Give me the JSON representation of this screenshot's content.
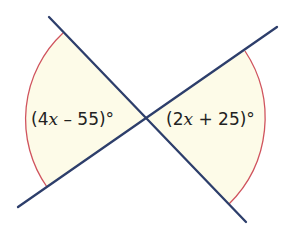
{
  "diagram": {
    "type": "vertical-angles",
    "intersection": {
      "x": 145,
      "y": 118
    },
    "lines": [
      {
        "id": "line-a",
        "x1": 49,
        "y1": 17,
        "x2": 246,
        "y2": 222
      },
      {
        "id": "line-b",
        "x1": 18,
        "y1": 207,
        "x2": 277,
        "y2": 27
      }
    ],
    "angles": [
      {
        "id": "left-angle",
        "label_prefix": "(4",
        "label_var": "x",
        "label_suffix": " – 55)°",
        "expression": "(4x – 55)°",
        "arc": {
          "start": {
            "x": 63,
            "y": 33
          },
          "end": {
            "x": 47,
            "y": 187
          },
          "radius": 118
        },
        "label_pos": {
          "x": 31,
          "y": 125
        }
      },
      {
        "id": "right-angle",
        "label_prefix": "(2",
        "label_var": "x",
        "label_suffix": " + 25)°",
        "expression": "(2x + 25)°",
        "arc": {
          "start": {
            "x": 245,
            "y": 51
          },
          "end": {
            "x": 229,
            "y": 204
          },
          "radius": 121
        },
        "label_pos": {
          "x": 166,
          "y": 125
        }
      }
    ],
    "colors": {
      "line": "#2d3e6b",
      "arc": "#d0545e",
      "fill": "#fdfbe8",
      "text": "#222222",
      "background": "#ffffff"
    }
  }
}
